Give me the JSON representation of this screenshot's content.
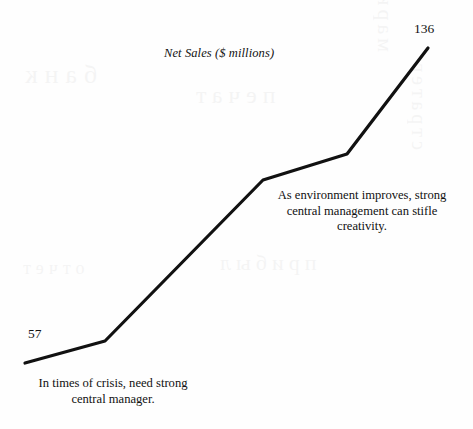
{
  "figure": {
    "title": "Net Sales ($ millions)",
    "background_color": "#fefefe",
    "line_color": "#111111"
  },
  "labels": {
    "start_value": "57",
    "end_value": "136"
  },
  "annotations": {
    "bottom_left": "In times of crisis, need strong central manager.",
    "middle_right": "As environment improves, strong central management can stifle creativity."
  },
  "ghosts": {
    "a": "банк",
    "b": "печат",
    "c": "прибыл",
    "d": "маркетинг",
    "e": "стратег",
    "f": "отчет"
  },
  "chart_data": {
    "type": "line",
    "title": "Net Sales ($ millions)",
    "xlabel": "",
    "ylabel": "Net Sales ($ millions)",
    "grid": false,
    "legend": false,
    "axes_visible": false,
    "series": [
      {
        "name": "Net Sales",
        "points": [
          {
            "x": 0,
            "y": 57,
            "px": 25,
            "py": 363,
            "label": "57"
          },
          {
            "x": 1,
            "y": 63,
            "px": 105,
            "py": 341,
            "label": ""
          },
          {
            "x": 2,
            "y": 108,
            "px": 263,
            "py": 180,
            "label": ""
          },
          {
            "x": 3,
            "y": 115,
            "px": 347,
            "py": 154,
            "label": ""
          },
          {
            "x": 4,
            "y": 136,
            "px": 428,
            "py": 48,
            "label": "136"
          }
        ],
        "values": [
          57,
          63,
          108,
          115,
          136
        ]
      }
    ],
    "annotations": [
      {
        "text": "In times of crisis, need strong central manager.",
        "anchor": "start-of-line",
        "position": "bottom-left"
      },
      {
        "text": "As environment improves, strong central management can stifle creativity.",
        "anchor": "upper-segment",
        "position": "middle-right"
      }
    ],
    "ylim": [
      40,
      145
    ],
    "xlim": [
      0,
      4
    ]
  }
}
